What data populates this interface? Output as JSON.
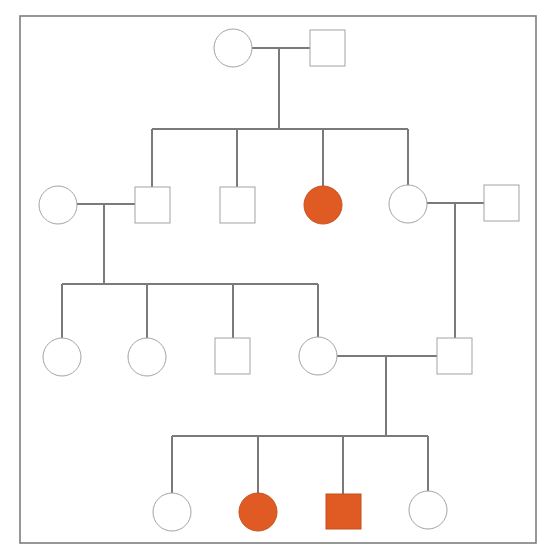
{
  "diagram": {
    "type": "pedigree-chart",
    "title": "",
    "colors": {
      "affected_fill": "#e05a24",
      "unaffected_fill": "#ffffff",
      "line": "#7a7a7a",
      "frame": "#7d7d7d"
    },
    "legend": {
      "circle": "female",
      "square": "male",
      "filled": "affected",
      "open": "unaffected"
    },
    "generations": [
      {
        "id": "I",
        "individuals": [
          {
            "id": "I-1",
            "sex": "female",
            "affected": false
          },
          {
            "id": "I-2",
            "sex": "male",
            "affected": false
          }
        ]
      },
      {
        "id": "II",
        "individuals": [
          {
            "id": "II-1",
            "sex": "female",
            "affected": false,
            "note": "spouse of II-2"
          },
          {
            "id": "II-2",
            "sex": "male",
            "affected": false,
            "parents": [
              "I-1",
              "I-2"
            ]
          },
          {
            "id": "II-3",
            "sex": "male",
            "affected": false,
            "parents": [
              "I-1",
              "I-2"
            ]
          },
          {
            "id": "II-4",
            "sex": "female",
            "affected": true,
            "parents": [
              "I-1",
              "I-2"
            ]
          },
          {
            "id": "II-5",
            "sex": "female",
            "affected": false,
            "parents": [
              "I-1",
              "I-2"
            ]
          },
          {
            "id": "II-6",
            "sex": "male",
            "affected": false,
            "note": "spouse of II-5"
          }
        ]
      },
      {
        "id": "III",
        "individuals": [
          {
            "id": "III-1",
            "sex": "female",
            "affected": false,
            "parents": [
              "II-1",
              "II-2"
            ]
          },
          {
            "id": "III-2",
            "sex": "female",
            "affected": false,
            "parents": [
              "II-1",
              "II-2"
            ]
          },
          {
            "id": "III-3",
            "sex": "male",
            "affected": false,
            "parents": [
              "II-1",
              "II-2"
            ]
          },
          {
            "id": "III-4",
            "sex": "female",
            "affected": false,
            "parents": [
              "II-1",
              "II-2"
            ]
          },
          {
            "id": "III-5",
            "sex": "male",
            "affected": false,
            "parents": [
              "II-5",
              "II-6"
            ]
          }
        ]
      },
      {
        "id": "IV",
        "individuals": [
          {
            "id": "IV-1",
            "sex": "female",
            "affected": false,
            "parents": [
              "III-4",
              "III-5"
            ]
          },
          {
            "id": "IV-2",
            "sex": "female",
            "affected": true,
            "parents": [
              "III-4",
              "III-5"
            ]
          },
          {
            "id": "IV-3",
            "sex": "male",
            "affected": true,
            "parents": [
              "III-4",
              "III-5"
            ]
          },
          {
            "id": "IV-4",
            "sex": "female",
            "affected": false,
            "parents": [
              "III-4",
              "III-5"
            ]
          }
        ]
      }
    ]
  }
}
